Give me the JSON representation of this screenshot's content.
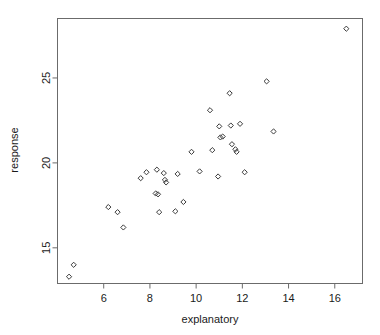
{
  "figure": {
    "background_color": "#ffffff",
    "frame_color": "#6b6b6b",
    "point_color": "#3a3a3a",
    "point_marker": "diamond-open"
  },
  "chart_data": {
    "type": "scatter",
    "title": "",
    "xlabel": "explanatory",
    "ylabel": "response",
    "xlim": [
      4.0,
      17.2
    ],
    "ylim": [
      12.9,
      28.5
    ],
    "xticks": [
      6,
      8,
      10,
      12,
      14,
      16
    ],
    "yticks": [
      15,
      20,
      25
    ],
    "xticklabels": [
      "6",
      "8",
      "10",
      "12",
      "14",
      "16"
    ],
    "yticklabels": [
      "15",
      "20",
      "25"
    ],
    "grid": false,
    "legend": null,
    "marker": "diamond",
    "marker_filled": false,
    "n_points": 44,
    "points": [
      {
        "x": 4.5,
        "y": 13.3
      },
      {
        "x": 4.7,
        "y": 14.0
      },
      {
        "x": 6.2,
        "y": 17.4
      },
      {
        "x": 6.6,
        "y": 17.1
      },
      {
        "x": 6.85,
        "y": 16.2
      },
      {
        "x": 7.6,
        "y": 19.1
      },
      {
        "x": 7.85,
        "y": 19.45
      },
      {
        "x": 8.3,
        "y": 19.6
      },
      {
        "x": 8.25,
        "y": 18.2
      },
      {
        "x": 8.35,
        "y": 18.15
      },
      {
        "x": 8.4,
        "y": 17.1
      },
      {
        "x": 8.6,
        "y": 19.4
      },
      {
        "x": 8.65,
        "y": 19.0
      },
      {
        "x": 8.7,
        "y": 18.85
      },
      {
        "x": 9.1,
        "y": 17.15
      },
      {
        "x": 9.2,
        "y": 19.35
      },
      {
        "x": 9.45,
        "y": 17.7
      },
      {
        "x": 9.8,
        "y": 20.65
      },
      {
        "x": 10.15,
        "y": 19.5
      },
      {
        "x": 10.6,
        "y": 23.1
      },
      {
        "x": 10.7,
        "y": 20.75
      },
      {
        "x": 10.95,
        "y": 19.2
      },
      {
        "x": 11.0,
        "y": 22.15
      },
      {
        "x": 11.05,
        "y": 21.5
      },
      {
        "x": 11.15,
        "y": 21.55
      },
      {
        "x": 11.45,
        "y": 24.1
      },
      {
        "x": 11.5,
        "y": 22.2
      },
      {
        "x": 11.55,
        "y": 21.1
      },
      {
        "x": 11.7,
        "y": 20.8
      },
      {
        "x": 11.75,
        "y": 20.65
      },
      {
        "x": 11.9,
        "y": 22.3
      },
      {
        "x": 12.1,
        "y": 19.45
      },
      {
        "x": 13.05,
        "y": 24.8
      },
      {
        "x": 13.35,
        "y": 21.85
      },
      {
        "x": 16.5,
        "y": 27.9
      }
    ]
  }
}
